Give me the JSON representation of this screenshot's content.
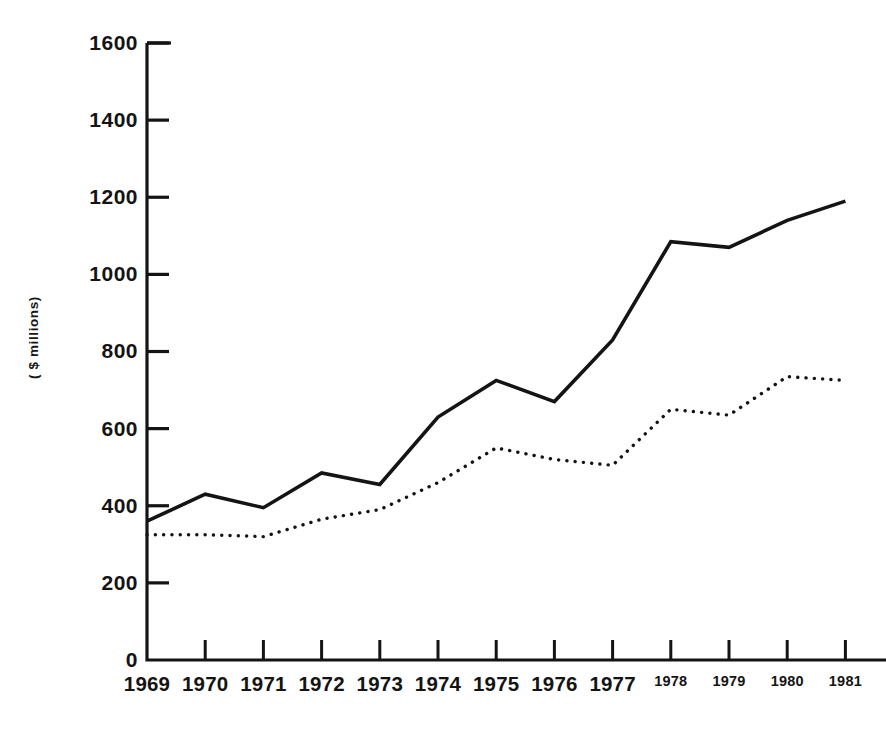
{
  "chart_data": {
    "type": "line",
    "title": "",
    "xlabel": "",
    "ylabel": "( $ millions)",
    "categories": [
      "1969",
      "1970",
      "1971",
      "1972",
      "1973",
      "1974",
      "1975",
      "1976",
      "1977",
      "1978",
      "1979",
      "1980",
      "1981"
    ],
    "x": [
      1969,
      1970,
      1971,
      1972,
      1973,
      1974,
      1975,
      1976,
      1977,
      1978,
      1979,
      1980,
      1981
    ],
    "ylim": [
      0,
      1600
    ],
    "xlim": [
      1969,
      1981
    ],
    "yticks": [
      0,
      200,
      400,
      600,
      800,
      1000,
      1200,
      1400,
      1600
    ],
    "ytick_labels": [
      "0",
      "200",
      "400",
      "600",
      "800",
      "1000",
      "1200",
      "1400",
      "1600"
    ],
    "grid": false,
    "legend": "none",
    "series": [
      {
        "name": "solid-line",
        "style": "solid",
        "color": "#141414",
        "values": [
          360,
          430,
          395,
          485,
          455,
          630,
          725,
          670,
          830,
          1085,
          1070,
          1140,
          1190
        ]
      },
      {
        "name": "dotted-line",
        "style": "dotted",
        "color": "#141414",
        "values": [
          325,
          325,
          320,
          365,
          390,
          460,
          550,
          520,
          505,
          650,
          635,
          735,
          725
        ]
      }
    ],
    "annotations": []
  },
  "axes": {
    "y_title": "( $ millions)",
    "y_tick_labels": [
      "1600",
      "1400",
      "1200",
      "1000",
      "800",
      "600",
      "400",
      "200",
      "0"
    ],
    "x_tick_labels": [
      "1969",
      "1970",
      "1971",
      "1972",
      "1973",
      "1974",
      "1975",
      "1976",
      "1977",
      "1978",
      "1979",
      "1980",
      "1981"
    ]
  }
}
